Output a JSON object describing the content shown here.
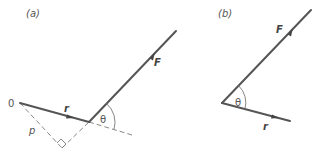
{
  "panels": {
    "a": {
      "label": "(a)",
      "origin_label": "0",
      "r_label": "r",
      "F_label": "F",
      "p_label": "p",
      "theta_label": "θ"
    },
    "b": {
      "label": "(b)",
      "r_label": "r",
      "F_label": "F",
      "theta_label": "θ"
    }
  },
  "colors": {
    "line": "#555555",
    "dashed": "#888888",
    "text": "#555555",
    "background": "#ffffff"
  }
}
